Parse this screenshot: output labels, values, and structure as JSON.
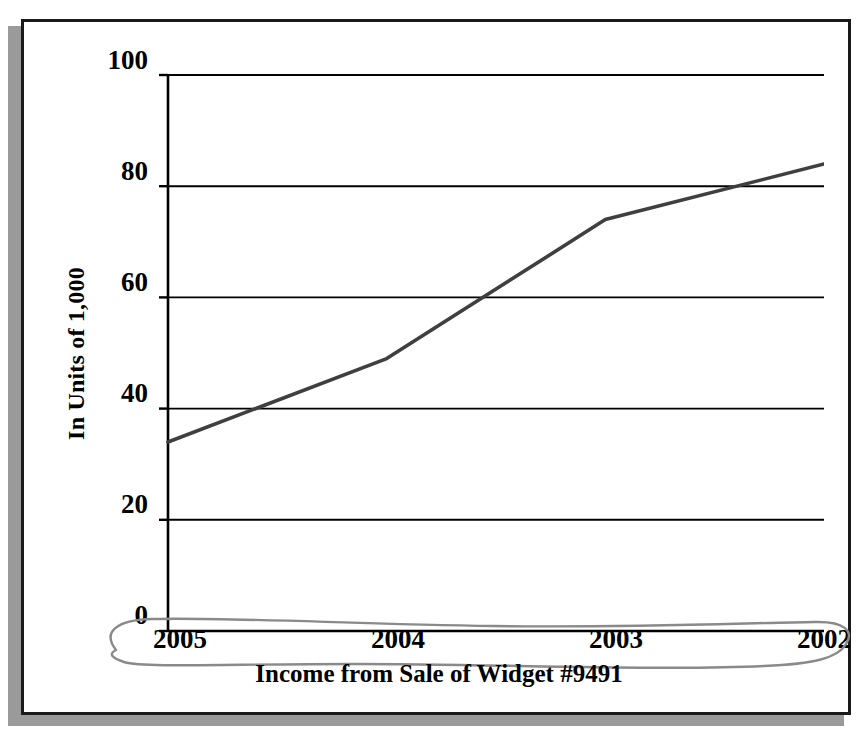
{
  "chart_data": {
    "type": "line",
    "title": "",
    "xlabel": "Income from Sale of Widget #9491",
    "ylabel": "In Units of 1,000",
    "categories": [
      "2005",
      "2004",
      "2003",
      "2002"
    ],
    "values": [
      34,
      49,
      74,
      84
    ],
    "series": [
      {
        "name": "Income from Sale of Widget #9491",
        "values": [
          34,
          49,
          74,
          84
        ]
      }
    ],
    "ylim": [
      0,
      100
    ],
    "yticks": [
      100,
      80,
      60,
      40,
      20,
      0
    ],
    "ytick_labels": [
      "100",
      "80",
      "60",
      "40",
      "20",
      "0"
    ],
    "xtick_labels": [
      "2005",
      "2004",
      "2003",
      "2002"
    ],
    "grid": "horizontal",
    "legend": "none",
    "line_color": "#3f3f3f",
    "axis_color": "#000000",
    "gridline_color": "#000000",
    "annotations": [
      {
        "kind": "hand-drawn-ellipse",
        "color": "#8a8a8a",
        "encircles": "x-axis year labels 2005 2004 2003 2002"
      }
    ]
  },
  "figure": {
    "frame_color": "#1a1a1a",
    "shadow_color": "#9a9a9a",
    "background": "#ffffff"
  }
}
